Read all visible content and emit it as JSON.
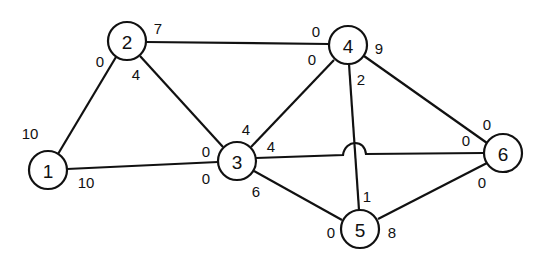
{
  "diagram": {
    "type": "network-flow-graph",
    "nodes": [
      {
        "id": "1",
        "label": "1",
        "x": 48,
        "y": 170
      },
      {
        "id": "2",
        "label": "2",
        "x": 127,
        "y": 41
      },
      {
        "id": "3",
        "label": "3",
        "x": 237,
        "y": 161
      },
      {
        "id": "4",
        "label": "4",
        "x": 348,
        "y": 45
      },
      {
        "id": "5",
        "label": "5",
        "x": 360,
        "y": 229
      },
      {
        "id": "6",
        "label": "6",
        "x": 503,
        "y": 153
      }
    ],
    "edges": [
      {
        "from": "1",
        "to": "2",
        "cap_from": "10",
        "cap_to": "0"
      },
      {
        "from": "1",
        "to": "3",
        "cap_from": "10",
        "cap_to": "0"
      },
      {
        "from": "2",
        "to": "3",
        "cap_from": "4",
        "cap_to": "4"
      },
      {
        "from": "2",
        "to": "4",
        "cap_from": "7",
        "cap_to": "0"
      },
      {
        "from": "3",
        "to": "4",
        "cap_from": "4",
        "cap_to": "0"
      },
      {
        "from": "3",
        "to": "6",
        "cap_from": "4",
        "cap_to": "0"
      },
      {
        "from": "3",
        "to": "5",
        "cap_from": "6",
        "cap_to": "0"
      },
      {
        "from": "4",
        "to": "5",
        "cap_from": "2",
        "cap_to": "1"
      },
      {
        "from": "4",
        "to": "6",
        "cap_from": "9",
        "cap_to": "0"
      },
      {
        "from": "5",
        "to": "6",
        "cap_from": "8",
        "cap_to": "0"
      }
    ],
    "edge_labels": [
      {
        "text": "10",
        "x": 30,
        "y": 133
      },
      {
        "text": "10",
        "x": 86,
        "y": 182
      },
      {
        "text": "0",
        "x": 100,
        "y": 61
      },
      {
        "text": "7",
        "x": 158,
        "y": 28
      },
      {
        "text": "4",
        "x": 136,
        "y": 74
      },
      {
        "text": "0",
        "x": 316,
        "y": 31
      },
      {
        "text": "0",
        "x": 312,
        "y": 59
      },
      {
        "text": "9",
        "x": 379,
        "y": 48
      },
      {
        "text": "2",
        "x": 361,
        "y": 79
      },
      {
        "text": "4",
        "x": 246,
        "y": 129
      },
      {
        "text": "4",
        "x": 271,
        "y": 146
      },
      {
        "text": "0",
        "x": 206,
        "y": 151
      },
      {
        "text": "0",
        "x": 206,
        "y": 178
      },
      {
        "text": "6",
        "x": 256,
        "y": 191
      },
      {
        "text": "0",
        "x": 487,
        "y": 124
      },
      {
        "text": "0",
        "x": 466,
        "y": 140
      },
      {
        "text": "0",
        "x": 482,
        "y": 182
      },
      {
        "text": "1",
        "x": 367,
        "y": 196
      },
      {
        "text": "0",
        "x": 331,
        "y": 232
      },
      {
        "text": "8",
        "x": 392,
        "y": 232
      }
    ]
  }
}
